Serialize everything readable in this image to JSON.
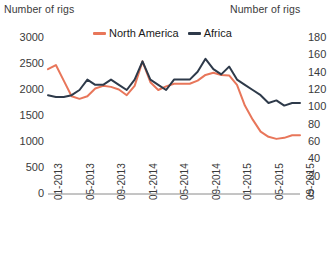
{
  "axis_titles": {
    "left": "Number of rigs",
    "right": "Number of rigs"
  },
  "legend": {
    "items": [
      {
        "label": "North America",
        "color": "#E8765A"
      },
      {
        "label": "Africa",
        "color": "#2E3A4A"
      }
    ]
  },
  "chart_data": {
    "type": "line",
    "title": "",
    "xlabel": "",
    "ylabel": "Number of rigs",
    "y2label": "Number of rigs",
    "grid": false,
    "legend_position": "top-center",
    "ylim": [
      0,
      3000
    ],
    "y2lim": [
      0,
      180
    ],
    "yticks": [
      3000,
      2500,
      2000,
      1500,
      1000,
      500,
      0
    ],
    "y2ticks": [
      180,
      160,
      140,
      120,
      100,
      80,
      60,
      40,
      20,
      0
    ],
    "xticks": [
      "01-2013",
      "05-2013",
      "09-2013",
      "01-2014",
      "05-2014",
      "09-2014",
      "01-2015",
      "05-2015",
      "09-2015"
    ],
    "x": [
      "01-2013",
      "02-2013",
      "03-2013",
      "04-2013",
      "05-2013",
      "06-2013",
      "07-2013",
      "08-2013",
      "09-2013",
      "10-2013",
      "11-2013",
      "12-2013",
      "01-2014",
      "02-2014",
      "03-2014",
      "04-2014",
      "05-2014",
      "06-2014",
      "07-2014",
      "08-2014",
      "09-2014",
      "10-2014",
      "11-2014",
      "12-2014",
      "01-2015",
      "02-2015",
      "03-2015",
      "04-2015",
      "05-2015",
      "06-2015",
      "07-2015",
      "08-2015",
      "09-2015"
    ],
    "series": [
      {
        "name": "North America",
        "color": "#E8765A",
        "axis": "left",
        "values": [
          2400,
          2480,
          2180,
          1880,
          1830,
          1880,
          2030,
          2080,
          2060,
          2010,
          1900,
          2080,
          2550,
          2150,
          2000,
          2070,
          2120,
          2120,
          2120,
          2180,
          2290,
          2330,
          2290,
          2280,
          2100,
          1700,
          1430,
          1200,
          1100,
          1060,
          1080,
          1130,
          1130
        ]
      },
      {
        "name": "Africa",
        "color": "#2E3A4A",
        "axis": "right",
        "values": [
          114,
          112,
          112,
          114,
          120,
          132,
          126,
          126,
          132,
          126,
          120,
          132,
          153,
          132,
          126,
          120,
          132,
          132,
          132,
          141,
          156,
          144,
          138,
          147,
          132,
          126,
          120,
          114,
          105,
          108,
          102,
          105,
          105
        ]
      }
    ]
  }
}
